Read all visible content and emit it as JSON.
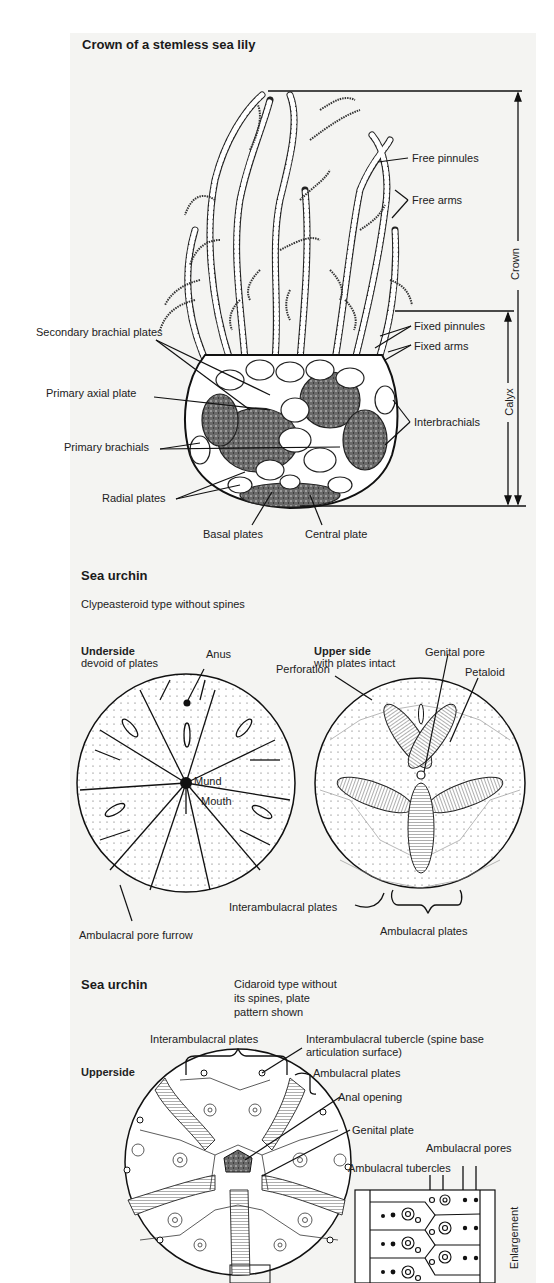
{
  "sea_lily": {
    "title": "Crown of a stemless sea lily",
    "labels": {
      "free_pinnules": "Free pinnules",
      "free_arms": "Free arms",
      "fixed_pinnules": "Fixed pinnules",
      "fixed_arms": "Fixed arms",
      "interbrachials": "Interbrachials",
      "secondary_brachial_plates": "Secondary brachial plates",
      "primary_axial_plate": "Primary axial plate",
      "primary_brachials": "Primary brachials",
      "radial_plates": "Radial plates",
      "basal_plates": "Basal plates",
      "central_plate": "Central plate"
    },
    "dimensions": {
      "crown": "Crown",
      "calyx": "Calyx"
    }
  },
  "clypeasteroid": {
    "title": "Sea urchin",
    "subtitle": "Clypeasteroid type without spines",
    "underside": {
      "heading": "Underside",
      "subheading": "devoid of plates",
      "labels": {
        "anus": "Anus",
        "mund": "Mund",
        "mouth": "Mouth",
        "ambulacral_pore_furrow": "Ambulacral pore furrow"
      }
    },
    "upper_side": {
      "heading": "Upper side",
      "subheading": "with plates intact",
      "labels": {
        "genital_pore": "Genital pore",
        "petaloid": "Petaloid",
        "perforation": "Perforation",
        "interambulacral_plates": "Interambulacral plates",
        "ambulacral_plates": "Ambulacral plates"
      }
    }
  },
  "cidaroid": {
    "title": "Sea urchin",
    "subtitle_lines": [
      "Cidaroid type without",
      "its spines, plate",
      "pattern shown"
    ],
    "view": "Upperside",
    "labels": {
      "interambulacral_plates": "Interambulacral plates",
      "interambulacral_tubercle_1": "Interambulacral tubercle (spine base",
      "interambulacral_tubercle_2": "articulation surface)",
      "ambulacral_plates": "Ambulacral plates",
      "anal_opening": "Anal opening",
      "genital_plate": "Genital plate",
      "ambulacral_pores": "Ambulacral pores",
      "ambulacral_tubercles": "Ambulacral tubercles",
      "enlargement": "Enlargement"
    }
  }
}
